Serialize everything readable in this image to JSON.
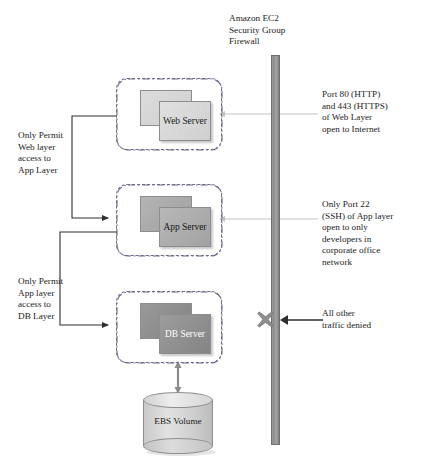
{
  "diagram": {
    "title_firewall": "Amazon EC2\nSecurity Group\nFirewall",
    "layers": [
      {
        "id": "web",
        "label": "Web\nServer",
        "name": "web-layer"
      },
      {
        "id": "app",
        "label": "App\nServer",
        "name": "app-layer"
      },
      {
        "id": "db",
        "label": "DB\nServer",
        "name": "db-layer"
      }
    ],
    "storage": {
      "label": "EBS\nVolume"
    },
    "left_notes": [
      {
        "text": "Only Permit\nWeb layer\naccess to\nApp Layer"
      },
      {
        "text": "Only Permit\nApp layer\naccess to\nDB Layer"
      }
    ],
    "right_notes": [
      {
        "text": "Port 80 (HTTP)\nand 443 (HTTPS)\nof Web Layer\nopen to Internet"
      },
      {
        "text": "Only Port 22\n(SSH) of App layer\nopen to only\ndevelopers in\ncorporate office\nnetwork"
      },
      {
        "text": "All other\ntraffic denied"
      }
    ],
    "caption": "",
    "colors": {
      "firewall_bar": "#8c8c8c",
      "web_tile": "#d4d4d4",
      "app_tile": "#a8a8a8",
      "db_tile": "#8a8a8a",
      "layer_border": "#6b6b8a",
      "x_mark": "#8f8f8f",
      "connector": "#3a3a3a",
      "allow_line": "#b8b8b8"
    }
  }
}
